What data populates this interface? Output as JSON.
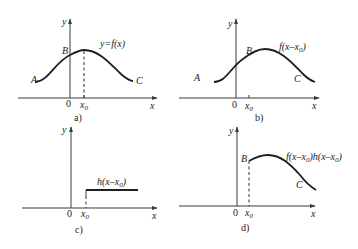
{
  "figure": {
    "panels": [
      {
        "id": "a",
        "caption": "a)",
        "axis_x": "x",
        "axis_y": "y",
        "origin": "0",
        "x0": "x",
        "x0_sub": "0",
        "points": {
          "A": "A",
          "B": "B",
          "C": "C"
        },
        "curve_label": "y=f(x)"
      },
      {
        "id": "b",
        "caption": "b)",
        "axis_x": "x",
        "axis_y": "y",
        "origin": "0",
        "x0": "x",
        "x0_sub": "0",
        "points": {
          "A": "A",
          "B": "B",
          "C": "C"
        },
        "curve_label_pre": "f(x–x",
        "curve_label_sub": "0",
        "curve_label_post": ")"
      },
      {
        "id": "c",
        "caption": "c)",
        "axis_x": "x",
        "axis_y": "y",
        "origin": "0",
        "x0": "x",
        "x0_sub": "0",
        "curve_label_pre": "h(x–x",
        "curve_label_sub": "0",
        "curve_label_post": ")"
      },
      {
        "id": "d",
        "caption": "d)",
        "axis_x": "x",
        "axis_y": "y",
        "origin": "0",
        "x0": "x",
        "x0_sub": "0",
        "points": {
          "B": "B",
          "C": "C"
        },
        "curve_label_pre1": "f(x–x",
        "curve_label_sub1": "0",
        "curve_label_mid": ")h(x–x",
        "curve_label_sub2": "0",
        "curve_label_post": ")"
      }
    ]
  }
}
